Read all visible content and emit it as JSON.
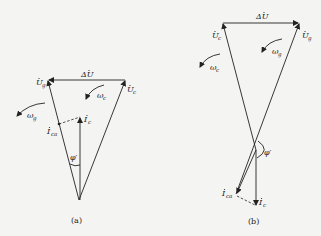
{
  "diagrams": [
    {
      "id": "a",
      "caption": "(a)",
      "labels": {
        "delta_u": "ΔU",
        "u_g": "U",
        "u_g_sub": "g",
        "u_c": "U",
        "u_c_sub": "c",
        "omega_c": "ω",
        "omega_c_sub": "c",
        "omega_g": "ω",
        "omega_g_sub": "g",
        "i_c": "I",
        "i_c_sub": "c",
        "i_ca": "I",
        "i_ca_sub": "ca",
        "phi": "φ′"
      }
    },
    {
      "id": "b",
      "caption": "(b)",
      "labels": {
        "delta_u": "ΔU",
        "u_c": "U",
        "u_c_sub": "c",
        "u_g": "U",
        "u_g_sub": "g",
        "omega_c": "ω",
        "omega_c_sub": "c",
        "omega_g": "ω",
        "omega_g_sub": "g",
        "i_c": "I",
        "i_c_sub": "c",
        "i_ca": "I",
        "i_ca_sub": "ca",
        "phi": "φ′"
      }
    }
  ]
}
